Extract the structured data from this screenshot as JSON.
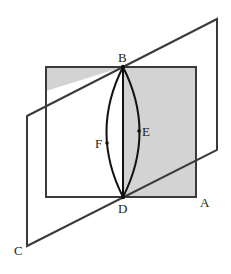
{
  "diagram": {
    "title": "",
    "colors": {
      "shade": "#d3d3d3",
      "stroke": "#3a3a3a",
      "curve": "#111111",
      "background": "#ffffff"
    },
    "points": {
      "A": {
        "label": "A",
        "x": 196,
        "y": 197
      },
      "B": {
        "label": "B",
        "x": 123,
        "y": 67
      },
      "C": {
        "label": "C",
        "x": 27,
        "y": 246
      },
      "D": {
        "label": "D",
        "x": 123,
        "y": 197
      },
      "E": {
        "label": "E",
        "x": 139,
        "y": 131
      },
      "F": {
        "label": "F",
        "x": 107,
        "y": 143
      }
    },
    "labels": {
      "A": "A",
      "B": "B",
      "C": "C",
      "D": "D",
      "E": "E",
      "F": "F"
    },
    "shapes": {
      "shaded_square": "vertical plane (gray rectangle) containing edge BD",
      "slanted_plane": "parallelogram through B and D with corner C",
      "segment_BD": "straight line BD",
      "arc_BED": "curve from B through E to D",
      "arc_BFD": "curve from B through F to D"
    }
  }
}
